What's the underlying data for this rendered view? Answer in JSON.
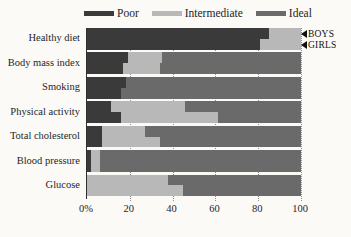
{
  "figure": {
    "background": "#fbfaf7",
    "width": 351,
    "height": 237
  },
  "chart_data": {
    "type": "bar",
    "orientation": "horizontal",
    "stacked": true,
    "unit": "percent",
    "title": "",
    "xlabel": "",
    "ylabel": "",
    "series_levels": [
      "Poor",
      "Intermediate",
      "Ideal"
    ],
    "legend": {
      "position": "top",
      "entries": [
        {
          "label": "Poor",
          "color": "#3a3a3a"
        },
        {
          "label": "Intermediate",
          "color": "#b8b8b8"
        },
        {
          "label": "Ideal",
          "color": "#6a6a6a"
        }
      ]
    },
    "categories": [
      "Healthy diet",
      "Body mass index",
      "Smoking",
      "Physical activity",
      "Total cholesterol",
      "Blood pressure",
      "Glucose"
    ],
    "groups": [
      {
        "category": "Healthy diet",
        "bars": [
          {
            "name": "BOYS",
            "values": [
              85,
              15,
              0
            ]
          },
          {
            "name": "GIRLS",
            "values": [
              81,
              19,
              0
            ]
          }
        ]
      },
      {
        "category": "Body mass index",
        "bars": [
          {
            "name": "BOYS",
            "values": [
              19,
              16,
              65
            ]
          },
          {
            "name": "GIRLS",
            "values": [
              17,
              17,
              66
            ]
          }
        ]
      },
      {
        "category": "Smoking",
        "bars": [
          {
            "name": "BOYS",
            "values": [
              18,
              0,
              82
            ]
          },
          {
            "name": "GIRLS",
            "values": [
              16,
              0,
              84
            ]
          }
        ]
      },
      {
        "category": "Physical activity",
        "bars": [
          {
            "name": "BOYS",
            "values": [
              11,
              35,
              54
            ]
          },
          {
            "name": "GIRLS",
            "values": [
              16,
              45,
              39
            ]
          }
        ]
      },
      {
        "category": "Total cholesterol",
        "bars": [
          {
            "name": "BOYS",
            "values": [
              7,
              20,
              73
            ]
          },
          {
            "name": "GIRLS",
            "values": [
              7,
              27,
              66
            ]
          }
        ]
      },
      {
        "category": "Blood pressure",
        "bars": [
          {
            "name": "BOYS",
            "values": [
              2,
              4,
              94
            ]
          },
          {
            "name": "GIRLS",
            "values": [
              2,
              4,
              94
            ]
          }
        ]
      },
      {
        "category": "Glucose",
        "bars": [
          {
            "name": "BOYS",
            "values": [
              0,
              38,
              62
            ]
          },
          {
            "name": "GIRLS",
            "values": [
              0,
              45,
              55
            ]
          }
        ]
      }
    ],
    "x_axis": {
      "range": [
        0,
        100
      ],
      "ticks": [
        "0%",
        "20",
        "40",
        "60",
        "80",
        "100"
      ],
      "tick_values": [
        0,
        20,
        40,
        60,
        80,
        100
      ],
      "gridlines": [
        20,
        40,
        60,
        80,
        100
      ],
      "grid_style": "dotted"
    },
    "annotations": [
      {
        "label": "BOYS",
        "marker": "left-triangle"
      },
      {
        "label": "GIRLS",
        "marker": "left-triangle"
      }
    ]
  }
}
